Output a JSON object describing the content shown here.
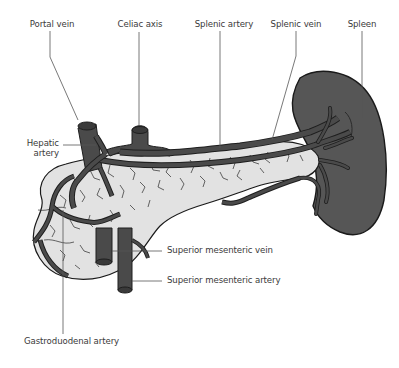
{
  "diagram": {
    "colors": {
      "vessel": "#4a4a4a",
      "vessel_outline": "#1e1e1e",
      "pancreas_fill": "#e3e3e3",
      "pancreas_outline": "#1a1a1a",
      "spleen_fill": "#555555",
      "leader_line": "#555555",
      "label_text": "#3a3a3a"
    },
    "labels": {
      "portal_vein": "Portal vein",
      "celiac_axis": "Celiac axis",
      "splenic_artery": "Splenic artery",
      "splenic_vein": "Splenic vein",
      "spleen": "Spleen",
      "hepatic_artery_line1": "Hepatic",
      "hepatic_artery_line2": "artery",
      "superior_mesenteric_vein": "Superior mesenteric vein",
      "superior_mesenteric_artery": "Superior mesenteric artery",
      "gastroduodenal_artery": "Gastroduodenal artery"
    }
  }
}
